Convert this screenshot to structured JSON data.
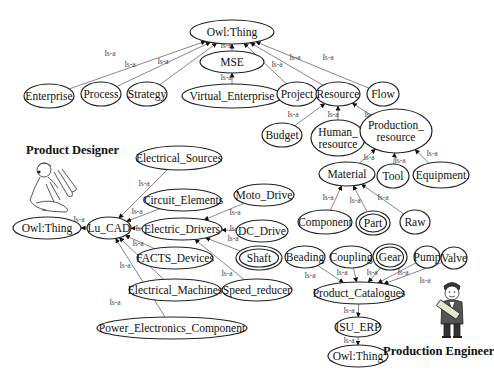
{
  "diagram": {
    "edge_label": "Is-a",
    "roles": {
      "product_designer": "Product Designer",
      "production_engineer": "Production Engineer"
    },
    "nodes": [
      {
        "id": "owl_top",
        "label": "Owl:Thing",
        "x": 232,
        "y": 32,
        "rx": 42,
        "ry": 12
      },
      {
        "id": "mse",
        "label": "MSE",
        "x": 232,
        "y": 62,
        "rx": 32,
        "ry": 11
      },
      {
        "id": "enterprise",
        "label": "Enterprise",
        "x": 49,
        "y": 96,
        "rx": 25,
        "ry": 12
      },
      {
        "id": "process",
        "label": "Process",
        "x": 101,
        "y": 94,
        "rx": 20,
        "ry": 12
      },
      {
        "id": "strategy",
        "label": "Strategy",
        "x": 147,
        "y": 94,
        "rx": 20,
        "ry": 12
      },
      {
        "id": "virtual_enterprise",
        "label": "Virtual_Enterprise",
        "x": 232,
        "y": 96,
        "rx": 50,
        "ry": 12
      },
      {
        "id": "project",
        "label": "Project",
        "x": 297,
        "y": 94,
        "rx": 20,
        "ry": 12
      },
      {
        "id": "resource",
        "label": "Resource",
        "x": 338,
        "y": 94,
        "rx": 22,
        "ry": 12
      },
      {
        "id": "flow",
        "label": "Flow",
        "x": 383,
        "y": 94,
        "rx": 16,
        "ry": 12
      },
      {
        "id": "budget",
        "label": "Budget",
        "x": 282,
        "y": 135,
        "rx": 20,
        "ry": 12
      },
      {
        "id": "human_resource",
        "label": "Human_|resource",
        "x": 338,
        "y": 138,
        "rx": 27,
        "ry": 18
      },
      {
        "id": "production_resource",
        "label": "Production_|resource",
        "x": 396,
        "y": 131,
        "rx": 36,
        "ry": 22
      },
      {
        "id": "material",
        "label": "Material",
        "x": 347,
        "y": 174,
        "rx": 28,
        "ry": 12
      },
      {
        "id": "tool",
        "label": "Tool",
        "x": 393,
        "y": 176,
        "rx": 16,
        "ry": 12
      },
      {
        "id": "equipment",
        "label": "Equipment",
        "x": 441,
        "y": 175,
        "rx": 28,
        "ry": 13
      },
      {
        "id": "component",
        "label": "Component",
        "x": 325,
        "y": 222,
        "rx": 27,
        "ry": 12
      },
      {
        "id": "part",
        "label": "Part",
        "x": 373,
        "y": 223,
        "rx": 17,
        "ry": 12,
        "double": true
      },
      {
        "id": "raw",
        "label": "Raw",
        "x": 415,
        "y": 222,
        "rx": 15,
        "ry": 12
      },
      {
        "id": "electrical_sources",
        "label": "Electrical_Sources",
        "x": 179,
        "y": 158,
        "rx": 43,
        "ry": 12
      },
      {
        "id": "circuit_elements",
        "label": "Circuit_Elements",
        "x": 183,
        "y": 200,
        "rx": 38,
        "ry": 11
      },
      {
        "id": "moto_drive",
        "label": "Moto_Drive",
        "x": 264,
        "y": 195,
        "rx": 30,
        "ry": 11
      },
      {
        "id": "owl_left",
        "label": "Owl:Thing",
        "x": 47,
        "y": 228,
        "rx": 34,
        "ry": 11
      },
      {
        "id": "lu_cad",
        "label": "Lu_CAD",
        "x": 109,
        "y": 228,
        "rx": 22,
        "ry": 11
      },
      {
        "id": "electric_drivers",
        "label": "Electric_Drivers",
        "x": 182,
        "y": 229,
        "rx": 40,
        "ry": 11
      },
      {
        "id": "dc_drive",
        "label": "DC_Drive",
        "x": 262,
        "y": 231,
        "rx": 26,
        "ry": 11
      },
      {
        "id": "facts_devices",
        "label": "FACTS_Devices",
        "x": 175,
        "y": 258,
        "rx": 38,
        "ry": 11
      },
      {
        "id": "shaft",
        "label": "Shaft",
        "x": 259,
        "y": 258,
        "rx": 23,
        "ry": 12,
        "double": true
      },
      {
        "id": "electrical_machines",
        "label": "Electrical_Machines",
        "x": 175,
        "y": 290,
        "rx": 46,
        "ry": 11
      },
      {
        "id": "speed_reducer",
        "label": "Speed_reducer",
        "x": 257,
        "y": 290,
        "rx": 35,
        "ry": 11
      },
      {
        "id": "power_electronics_component",
        "label": "Power_Electronics_Component",
        "x": 172,
        "y": 328,
        "rx": 75,
        "ry": 11
      },
      {
        "id": "beading",
        "label": "Beading",
        "x": 305,
        "y": 257,
        "rx": 20,
        "ry": 11
      },
      {
        "id": "coupling",
        "label": "Coupling",
        "x": 351,
        "y": 257,
        "rx": 21,
        "ry": 11
      },
      {
        "id": "gear",
        "label": "Gear",
        "x": 390,
        "y": 257,
        "rx": 17,
        "ry": 13,
        "double": true
      },
      {
        "id": "pump",
        "label": "Pump",
        "x": 427,
        "y": 257,
        "rx": 13,
        "ry": 11
      },
      {
        "id": "valve",
        "label": "Valve",
        "x": 454,
        "y": 258,
        "rx": 13,
        "ry": 11
      },
      {
        "id": "product_catalogues",
        "label": "Product_Catalogues",
        "x": 359,
        "y": 293,
        "rx": 45,
        "ry": 11
      },
      {
        "id": "isu_erp",
        "label": "ISU_ERP",
        "x": 358,
        "y": 327,
        "rx": 23,
        "ry": 10
      },
      {
        "id": "owl_bottom",
        "label": "Owl:Thing",
        "x": 358,
        "y": 356,
        "rx": 30,
        "ry": 11
      }
    ],
    "edges": [
      {
        "from": "enterprise",
        "to": "owl_top",
        "lx": 110,
        "ly": 53
      },
      {
        "from": "process",
        "to": "owl_top",
        "lx": 130,
        "ly": 64
      },
      {
        "from": "strategy",
        "to": "owl_top",
        "lx": 163,
        "ly": 61
      },
      {
        "from": "mse",
        "to": "owl_top",
        "lx": 226,
        "ly": 45
      },
      {
        "from": "virtual_enterprise",
        "to": "mse",
        "lx": 226,
        "ly": 77
      },
      {
        "from": "project",
        "to": "owl_top",
        "lx": 277,
        "ly": 64
      },
      {
        "from": "resource",
        "to": "owl_top",
        "lx": 295,
        "ly": 57
      },
      {
        "from": "flow",
        "to": "owl_top",
        "lx": 328,
        "ly": 57
      },
      {
        "from": "budget",
        "to": "resource",
        "lx": 293,
        "ly": 114
      },
      {
        "from": "human_resource",
        "to": "resource",
        "lx": 333,
        "ly": 114
      },
      {
        "from": "production_resource",
        "to": "resource",
        "lx": 370,
        "ly": 114
      },
      {
        "from": "material",
        "to": "production_resource",
        "lx": 369,
        "ly": 157
      },
      {
        "from": "tool",
        "to": "production_resource",
        "lx": 400,
        "ly": 160
      },
      {
        "from": "equipment",
        "to": "production_resource",
        "lx": 432,
        "ly": 153
      },
      {
        "from": "component",
        "to": "material",
        "lx": 328,
        "ly": 197
      },
      {
        "from": "part",
        "to": "material",
        "lx": 355,
        "ly": 200
      },
      {
        "from": "raw",
        "to": "material",
        "lx": 383,
        "ly": 197
      },
      {
        "from": "electrical_sources",
        "to": "lu_cad",
        "lx": 144,
        "ly": 183
      },
      {
        "from": "circuit_elements",
        "to": "lu_cad",
        "lx": 137,
        "ly": 211
      },
      {
        "from": "electric_drivers",
        "to": "lu_cad",
        "lx": 141,
        "ly": 228
      },
      {
        "from": "facts_devices",
        "to": "lu_cad",
        "lx": 138,
        "ly": 243
      },
      {
        "from": "electrical_machines",
        "to": "lu_cad",
        "lx": 125,
        "ly": 265
      },
      {
        "from": "power_electronics_component",
        "to": "lu_cad",
        "lx": 115,
        "ly": 302
      },
      {
        "from": "lu_cad",
        "to": "owl_left",
        "lx": 79,
        "ly": 219
      },
      {
        "from": "moto_drive",
        "to": "electric_drivers",
        "lx": 235,
        "ly": 212
      },
      {
        "from": "dc_drive",
        "to": "electric_drivers",
        "lx": 235,
        "ly": 228
      },
      {
        "from": "shaft",
        "to": "electric_drivers",
        "lx": 233,
        "ly": 238
      },
      {
        "from": "speed_reducer",
        "to": "electric_drivers",
        "lx": 227,
        "ly": 273
      },
      {
        "from": "beading",
        "to": "product_catalogues",
        "lx": 310,
        "ly": 275
      },
      {
        "from": "coupling",
        "to": "product_catalogues",
        "lx": 342,
        "ly": 272
      },
      {
        "from": "gear",
        "to": "product_catalogues",
        "lx": 372,
        "ly": 272
      },
      {
        "from": "pump",
        "to": "product_catalogues",
        "lx": 403,
        "ly": 272
      },
      {
        "from": "valve",
        "to": "product_catalogues",
        "lx": 425,
        "ly": 280
      },
      {
        "from": "product_catalogues",
        "to": "isu_erp",
        "lx": 349,
        "ly": 310
      },
      {
        "from": "isu_erp",
        "to": "owl_bottom",
        "lx": 349,
        "ly": 340
      }
    ]
  }
}
